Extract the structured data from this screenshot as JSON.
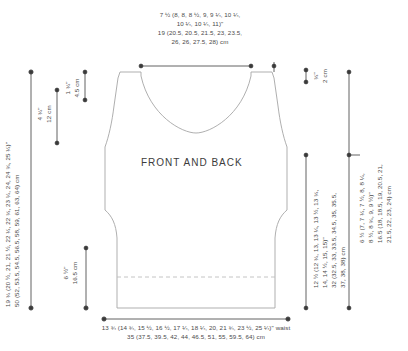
{
  "diagram": {
    "title_text": "FRONT AND BACK",
    "shape_name": "tank-top-schematic",
    "stroke_color": "#9a9a9a",
    "dim_color": "#3a3a3a",
    "background": "#ffffff"
  },
  "labels": {
    "top_shoulder_in": "7 ½ (8, 8, 8 ½, 9, 9 ¼, 10 ¼,",
    "top_shoulder_in2": "10 ¼, 10 ¼, 11)\"",
    "top_shoulder_cm": "19 (20.5, 20.5, 21.5, 23, 23.5,",
    "top_shoulder_cm2": "26, 26, 27.5, 28) cm",
    "left_length_in": "19 ¾ (20 ½, 21, 21 ½, 22 ¼, 22 ¾, 23 ¼, 24, 24 ¾, 25 ¼)\"",
    "left_length_cm": "50 (52, 53.5, 54.5, 56.5, 58, 59, 61, 63, 64) cm",
    "left_armhole_in": "4 ¾\"",
    "left_armhole_cm": "12 cm",
    "shoulder_slope_in": "1 ¾\"",
    "shoulder_slope_cm": "4.5 cm",
    "right_neck_in": "¾\"",
    "right_neck_cm": "2 cm",
    "right_armhole_in": "6 ½ (7, 7 ¼, 7 ½, 8, 8 ¼,",
    "right_armhole_in2": "8 ½, 8 ¾, 9, 9 ½)\"",
    "right_armhole_cm": "16.5 (18, 18.5, 19, 20.5, 21,",
    "right_armhole_cm2": "21.5, 22, 23, 24) cm",
    "right_body_in": "12 ½ (12 ¾, 13, 13 ¼, 13 ½, 13 ¾,",
    "right_body_in2": "14, 14 ½, 15, 15)\"",
    "right_body_cm": "32 (32.5, 33, 33.5, 34.5, 35, 35.5,",
    "right_body_cm2": "37, 38, 38) cm",
    "bottom_hem_in": "6 ½\"",
    "bottom_hem_cm": "16.5 cm",
    "bottom_waist_in": "13 ¾ (14 ¾, 15 ½, 16 ½, 17 ¼, 18 ¼, 20, 21 ¾, 23 ½, 25 ¼)\" waist",
    "bottom_waist_cm": "35 (37.5, 39.5, 42, 44, 46.5, 51, 55, 59.5, 64) cm"
  }
}
